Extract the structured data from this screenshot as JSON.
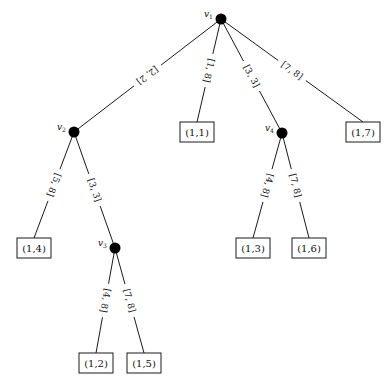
{
  "diagram": {
    "type": "tree",
    "nodes": [
      {
        "id": "v1",
        "label": "v",
        "sub": "1",
        "x": 221,
        "y": 19
      },
      {
        "id": "v2",
        "label": "v",
        "sub": "2",
        "x": 74,
        "y": 132
      },
      {
        "id": "v3",
        "label": "v",
        "sub": "3",
        "x": 115,
        "y": 248
      },
      {
        "id": "v4",
        "label": "v",
        "sub": "4",
        "x": 282,
        "y": 133
      }
    ],
    "leaves": [
      {
        "id": "l11",
        "text": "(1,1)",
        "x": 197,
        "y": 132
      },
      {
        "id": "l17",
        "text": "(1,7)",
        "x": 363,
        "y": 132
      },
      {
        "id": "l14",
        "text": "(1,4)",
        "x": 34,
        "y": 248
      },
      {
        "id": "l13",
        "text": "(1,3)",
        "x": 253,
        "y": 248
      },
      {
        "id": "l16",
        "text": "(1,6)",
        "x": 309,
        "y": 248
      },
      {
        "id": "l12",
        "text": "(1,2)",
        "x": 96,
        "y": 363
      },
      {
        "id": "l15",
        "text": "(1,5)",
        "x": 144,
        "y": 363
      }
    ],
    "edges": [
      {
        "from": "v1",
        "to": "v2",
        "label": "[2, 2]"
      },
      {
        "from": "v1",
        "to": "l11",
        "label": "[1, 8]"
      },
      {
        "from": "v1",
        "to": "v4",
        "label": "[3, 3]"
      },
      {
        "from": "v1",
        "to": "l17",
        "label": "[7, 8]"
      },
      {
        "from": "v2",
        "to": "l14",
        "label": "[5, 8]"
      },
      {
        "from": "v2",
        "to": "v3",
        "label": "[3, 3]"
      },
      {
        "from": "v3",
        "to": "l12",
        "label": "[4, 8]"
      },
      {
        "from": "v3",
        "to": "l15",
        "label": "[7, 8]"
      },
      {
        "from": "v4",
        "to": "l13",
        "label": "[4, 8]"
      },
      {
        "from": "v4",
        "to": "l16",
        "label": "[7, 8]"
      }
    ]
  }
}
